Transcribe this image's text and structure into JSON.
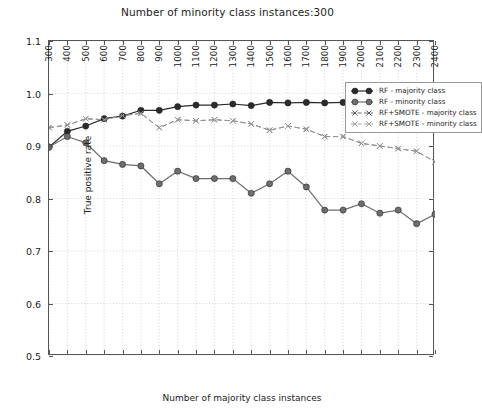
{
  "chart_data": {
    "type": "line",
    "title": "Number of minority class instances:300",
    "xlabel": "Number of majority class instances",
    "ylabel": "True positive rate",
    "xlim": [
      300,
      2400
    ],
    "ylim": [
      0.5,
      1.1
    ],
    "xticks": [
      300,
      400,
      500,
      600,
      700,
      800,
      900,
      1000,
      1100,
      1200,
      1300,
      1400,
      1500,
      1600,
      1700,
      1800,
      1900,
      2000,
      2100,
      2200,
      2300,
      2400
    ],
    "yticks": [
      0.5,
      0.6,
      0.7,
      0.8,
      0.9,
      1.0,
      1.1
    ],
    "ytick_labels": [
      "0.5",
      "0.6",
      "0.7",
      "0.8",
      "0.9",
      "1.0",
      "1.1"
    ],
    "grid": true,
    "legend_position": "upper right",
    "x": [
      300,
      400,
      500,
      600,
      700,
      800,
      900,
      1000,
      1100,
      1200,
      1300,
      1400,
      1500,
      1600,
      1700,
      1800,
      1900,
      2000,
      2100,
      2200,
      2300,
      2400
    ],
    "series": [
      {
        "name": "RF - majority class",
        "style": "solid",
        "marker": "circle",
        "color": "#2b2b2b",
        "values": [
          0.898,
          0.928,
          0.938,
          0.952,
          0.957,
          0.968,
          0.968,
          0.975,
          0.978,
          0.978,
          0.98,
          0.977,
          0.983,
          0.982,
          0.983,
          0.982,
          0.983,
          0.983,
          0.984,
          0.984,
          0.985,
          0.985
        ]
      },
      {
        "name": "RF - minority class",
        "style": "solid",
        "marker": "circle",
        "color": "#6e6e6e",
        "values": [
          0.898,
          0.918,
          0.906,
          0.872,
          0.865,
          0.862,
          0.828,
          0.852,
          0.838,
          0.838,
          0.838,
          0.81,
          0.828,
          0.852,
          0.822,
          0.778,
          0.778,
          0.79,
          0.772,
          0.778,
          0.752,
          0.77
        ]
      },
      {
        "name": "RF+SMOTE - majority class",
        "style": "dashed",
        "marker": "x",
        "color": "#5a5a5a",
        "values": [
          0.935,
          0.94,
          0.952,
          0.95,
          0.958,
          0.962,
          0.935,
          0.95,
          0.948,
          0.95,
          0.948,
          0.942,
          0.93,
          0.938,
          0.932,
          0.918,
          0.918,
          0.905,
          0.9,
          0.895,
          0.89,
          0.87
        ]
      },
      {
        "name": "RF+SMOTE - minority class",
        "style": "dashed",
        "marker": "x",
        "color": "#9a9a9a",
        "values": [
          0.935,
          0.94,
          0.952,
          0.95,
          0.958,
          0.962,
          0.935,
          0.95,
          0.948,
          0.95,
          0.948,
          0.942,
          0.93,
          0.938,
          0.932,
          0.918,
          0.918,
          0.905,
          0.9,
          0.895,
          0.89,
          0.87
        ]
      }
    ]
  },
  "legend": {
    "items": [
      {
        "label": "RF - majority class"
      },
      {
        "label": "RF - minority class"
      },
      {
        "label": "RF+SMOTE - majority class"
      },
      {
        "label": "RF+SMOTE - minority class"
      }
    ]
  }
}
